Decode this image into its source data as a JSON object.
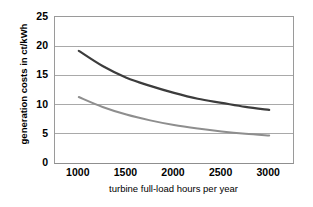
{
  "chart_data": {
    "type": "line",
    "title": "",
    "xlabel": "turbine full-load hours per year",
    "ylabel": "generation costs in ct/kWh",
    "xlim": [
      750,
      3250
    ],
    "ylim": [
      0,
      25
    ],
    "xticks": [
      1000,
      1500,
      2000,
      2500,
      3000
    ],
    "xtick_labels": [
      "1000",
      "1500",
      "2000",
      "2500",
      "3000"
    ],
    "yticks": [
      0,
      5,
      10,
      15,
      20,
      25
    ],
    "ytick_labels": [
      "0",
      "5",
      "10",
      "15",
      "20",
      "25"
    ],
    "grid": "horizontal",
    "legend": "none",
    "x": [
      1000,
      1250,
      1500,
      1750,
      2000,
      2250,
      2500,
      2750,
      3000
    ],
    "series": [
      {
        "name": "upper-curve",
        "color": "#3c3c3c",
        "linewidth": 2.2,
        "values": [
          19.2,
          16.6,
          14.6,
          13.2,
          12.0,
          11.0,
          10.3,
          9.6,
          9.1
        ]
      },
      {
        "name": "lower-curve",
        "color": "#8e8e8e",
        "linewidth": 2.0,
        "values": [
          11.3,
          9.6,
          8.3,
          7.3,
          6.5,
          5.9,
          5.4,
          5.0,
          4.7
        ]
      }
    ],
    "colors": {
      "upper_curve": "#3c3c3c",
      "lower_curve": "#8e8e8e",
      "gridline": "#a9a9a9",
      "axis": "#8f8f8f",
      "background": "#ffffff",
      "text": "#000000"
    }
  }
}
